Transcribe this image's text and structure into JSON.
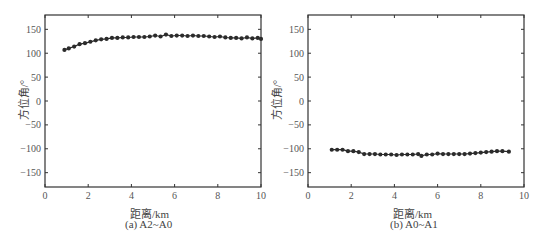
{
  "chart_data": [
    {
      "type": "line",
      "title": "",
      "caption": "(a) A2~A0",
      "xlabel": "距离/km",
      "ylabel": "方位角/°",
      "xlim": [
        0,
        10
      ],
      "ylim": [
        -180,
        180
      ],
      "xticks": [
        0,
        2,
        4,
        6,
        8,
        10
      ],
      "yticks": [
        150,
        100,
        50,
        0,
        -50,
        -100,
        -150
      ],
      "grid": false,
      "legend": null,
      "marker": "dot",
      "series": [
        {
          "name": "A2~A0",
          "x": [
            0.9,
            1.1,
            1.35,
            1.6,
            1.85,
            2.1,
            2.35,
            2.6,
            2.85,
            3.1,
            3.35,
            3.6,
            3.85,
            4.1,
            4.35,
            4.6,
            4.85,
            5.1,
            5.35,
            5.6,
            5.85,
            6.1,
            6.35,
            6.6,
            6.85,
            7.1,
            7.35,
            7.6,
            7.85,
            8.1,
            8.35,
            8.6,
            8.85,
            9.1,
            9.35,
            9.6,
            9.85,
            10.0
          ],
          "y": [
            107,
            110,
            114,
            119,
            121,
            124,
            127,
            129,
            130,
            132,
            132,
            133,
            133,
            134,
            134,
            134,
            135,
            137,
            135,
            139,
            136,
            137,
            137,
            136,
            137,
            136,
            136,
            135,
            134,
            135,
            133,
            132,
            132,
            131,
            133,
            131,
            132,
            130
          ]
        }
      ]
    },
    {
      "type": "line",
      "title": "",
      "caption": "(b) A0~A1",
      "xlabel": "距离/km",
      "ylabel": "方位角/°",
      "xlim": [
        0,
        10
      ],
      "ylim": [
        -180,
        180
      ],
      "xticks": [
        0,
        2,
        4,
        6,
        8,
        10
      ],
      "yticks": [
        150,
        100,
        50,
        0,
        -50,
        -100,
        -150
      ],
      "grid": false,
      "legend": null,
      "marker": "dot",
      "series": [
        {
          "name": "A0~A1",
          "x": [
            1.1,
            1.35,
            1.6,
            1.85,
            2.1,
            2.35,
            2.6,
            2.85,
            3.1,
            3.35,
            3.6,
            3.85,
            4.1,
            4.35,
            4.6,
            4.85,
            5.1,
            5.25,
            5.5,
            5.75,
            6.0,
            6.25,
            6.5,
            6.75,
            7.0,
            7.25,
            7.5,
            7.75,
            8.0,
            8.25,
            8.5,
            8.75,
            9.0,
            9.3
          ],
          "y": [
            -102,
            -102,
            -102,
            -105,
            -105,
            -107,
            -111,
            -111,
            -111,
            -112,
            -112,
            -112,
            -113,
            -112,
            -112,
            -112,
            -111,
            -115,
            -112,
            -112,
            -110,
            -111,
            -111,
            -111,
            -111,
            -111,
            -110,
            -109,
            -108,
            -107,
            -106,
            -105,
            -105,
            -106
          ]
        }
      ]
    }
  ],
  "panels": [
    {
      "ylabel": "方位角/°",
      "xlabel": "距离/km",
      "caption": "(a) A2~A0"
    },
    {
      "ylabel": "方位角/°",
      "xlabel": "距离/km",
      "caption": "(b) A0~A1"
    }
  ],
  "style": {
    "line_color": "#2b2b2b",
    "marker_color": "#2b2b2b",
    "axis_color": "#333333"
  }
}
